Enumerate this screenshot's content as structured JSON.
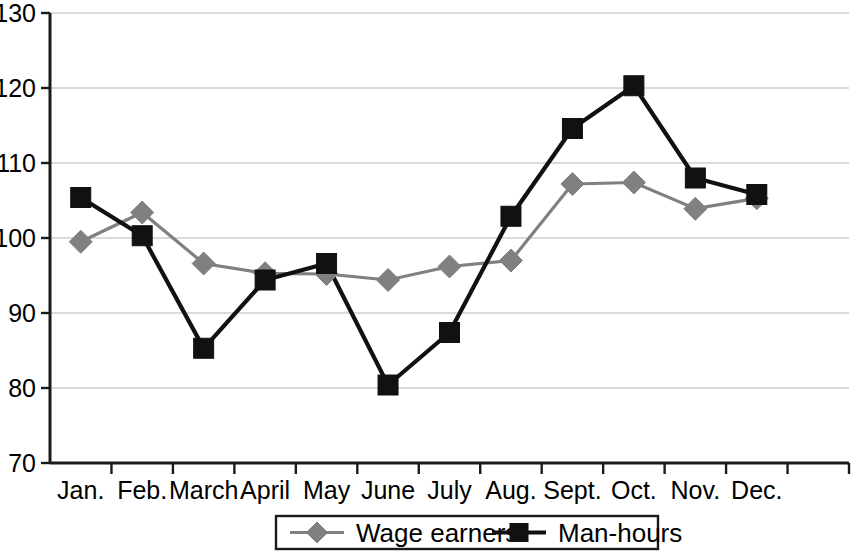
{
  "chart_data": {
    "type": "line",
    "title": "",
    "subtitle": "",
    "xlabel": "",
    "ylabel": "",
    "categories": [
      "Jan.",
      "Feb.",
      "March",
      "April",
      "May",
      "June",
      "July",
      "Aug.",
      "Sept.",
      "Oct.",
      "Nov.",
      "Dec."
    ],
    "ylim": [
      70,
      130
    ],
    "y_ticks": [
      70,
      80,
      90,
      100,
      110,
      120,
      130
    ],
    "grid": "horizontal",
    "legend_position": "bottom-center",
    "series": [
      {
        "name": "Wage earners",
        "color": "#808080",
        "marker": "diamond",
        "values": [
          99.5,
          103.4,
          96.6,
          95.3,
          95.2,
          94.4,
          96.2,
          97.0,
          107.2,
          107.4,
          103.9,
          105.3
        ]
      },
      {
        "name": "Man-hours",
        "color": "#111111",
        "marker": "square",
        "values": [
          105.4,
          100.3,
          85.3,
          94.4,
          96.6,
          80.4,
          87.4,
          102.9,
          114.6,
          120.3,
          108.0,
          105.8
        ]
      }
    ]
  },
  "axes": {
    "y_tick_labels": [
      "70",
      "80",
      "90",
      "100",
      "110",
      "120",
      "130"
    ],
    "x_tick_labels": [
      "Jan.",
      "Feb.",
      "March",
      "April",
      "May",
      "June",
      "July",
      "Aug.",
      "Sept.",
      "Oct.",
      "Nov.",
      "Dec."
    ]
  },
  "legend": {
    "entries": [
      {
        "label": "Wage earners",
        "color": "#808080",
        "marker": "diamond"
      },
      {
        "label": "Man-hours",
        "color": "#111111",
        "marker": "square"
      }
    ]
  },
  "colors": {
    "wage_earners": "#808080",
    "man_hours": "#111111",
    "gridline": "#b8b8b8",
    "axis": "#1a1a1a",
    "background": "#ffffff"
  }
}
